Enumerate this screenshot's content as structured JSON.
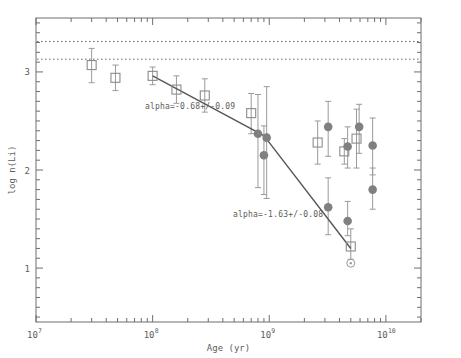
{
  "figure": {
    "axis_labels": {
      "x": "Age (yr)",
      "y": "log n(Li)"
    },
    "annotations": [
      {
        "id": "fit1",
        "text": "alpha=-0.68+/-0.09",
        "x": 0.345,
        "y": 2.62
      },
      {
        "id": "fit2",
        "text": "alpha=-1.63+/-0.08",
        "x": 2100000000.0,
        "y": 1.52
      }
    ],
    "xticklabels": [
      {
        "base": "10",
        "exp": "7",
        "value": 10000000.0
      },
      {
        "base": "10",
        "exp": "8",
        "value": 100000000.0
      },
      {
        "base": "10",
        "exp": "9",
        "value": 1000000000.0
      },
      {
        "base": "10",
        "exp": "10",
        "value": 10000000000.0
      }
    ],
    "yticklabels": [
      {
        "label": "1",
        "value": 1
      },
      {
        "label": "2",
        "value": 2
      },
      {
        "label": "3",
        "value": 3
      }
    ]
  },
  "chart_data": {
    "type": "scatter",
    "title": "",
    "xlabel": "Age (yr)",
    "ylabel": "log n(Li)",
    "xscale": "log",
    "yscale": "linear",
    "xlim": [
      10000000,
      20000000000
    ],
    "ylim": [
      0.45,
      3.55
    ],
    "grid": false,
    "legend": null,
    "reference_lines": [
      {
        "name": "meteoritic-abundance-upper",
        "style": "dotted",
        "y": 3.31
      },
      {
        "name": "meteoritic-abundance-lower",
        "style": "dotted",
        "y": 3.13
      }
    ],
    "fit_segments": [
      {
        "name": "early-decline-fit",
        "slope_label": "alpha=-0.68+/-0.09",
        "slope": -0.68,
        "slope_error": 0.09,
        "points": [
          [
            100000000,
            2.96
          ],
          [
            900000000,
            2.35
          ]
        ]
      },
      {
        "name": "late-decline-fit",
        "slope_label": "alpha=-1.63+/-0.08",
        "slope": -1.63,
        "slope_error": 0.08,
        "points": [
          [
            900000000,
            2.35
          ],
          [
            5000000000,
            1.2
          ]
        ]
      }
    ],
    "series": [
      {
        "name": "open-squares",
        "marker": "open-square",
        "color": "#8c8c8c",
        "points": [
          {
            "x": 30000000,
            "y": 3.07,
            "yerr_lo": 0.18,
            "yerr_hi": 0.17
          },
          {
            "x": 48000000,
            "y": 2.94,
            "yerr_lo": 0.13,
            "yerr_hi": 0.13
          },
          {
            "x": 100000000,
            "y": 2.96,
            "yerr_lo": 0.09,
            "yerr_hi": 0.09
          },
          {
            "x": 160000000,
            "y": 2.82,
            "yerr_lo": 0.14,
            "yerr_hi": 0.14
          },
          {
            "x": 280000000,
            "y": 2.76,
            "yerr_lo": 0.17,
            "yerr_hi": 0.17
          },
          {
            "x": 700000000,
            "y": 2.58,
            "yerr_lo": 0.21,
            "yerr_hi": 0.2
          },
          {
            "x": 2600000000,
            "y": 2.28,
            "yerr_lo": 0.22,
            "yerr_hi": 0.22
          },
          {
            "x": 4400000000,
            "y": 2.19,
            "yerr_lo": 0.13,
            "yerr_hi": 0.13
          },
          {
            "x": 5600000000,
            "y": 2.32,
            "yerr_lo": 0.3,
            "yerr_hi": 0.3
          },
          {
            "x": 5000000000,
            "y": 1.22,
            "yerr_lo": 0.13,
            "yerr_hi": 0.18
          }
        ]
      },
      {
        "name": "filled-circles",
        "marker": "filled-circle",
        "color": "#808080",
        "points": [
          {
            "x": 800000000,
            "y": 2.37,
            "yerr_lo": 0.55,
            "yerr_hi": 0.4
          },
          {
            "x": 950000000,
            "y": 2.33,
            "yerr_lo": 0.62,
            "yerr_hi": 0.52
          },
          {
            "x": 900000000,
            "y": 2.15,
            "yerr_lo": 0.4,
            "yerr_hi": 0.3
          },
          {
            "x": 3200000000,
            "y": 2.44,
            "yerr_lo": 0.3,
            "yerr_hi": 0.26
          },
          {
            "x": 4700000000,
            "y": 2.24,
            "yerr_lo": 0.22,
            "yerr_hi": 0.2
          },
          {
            "x": 5900000000,
            "y": 2.44,
            "yerr_lo": 0.27,
            "yerr_hi": 0.23
          },
          {
            "x": 7700000000,
            "y": 2.25,
            "yerr_lo": 0.3,
            "yerr_hi": 0.28
          },
          {
            "x": 3200000000,
            "y": 1.62,
            "yerr_lo": 0.28,
            "yerr_hi": 0.3
          },
          {
            "x": 4700000000,
            "y": 1.48,
            "yerr_lo": 0.15,
            "yerr_hi": 0.2
          },
          {
            "x": 7700000000,
            "y": 1.8,
            "yerr_lo": 0.2,
            "yerr_hi": 0.22
          }
        ]
      },
      {
        "name": "solar-symbol",
        "marker": "sun",
        "color": "#9a9a9a",
        "points": [
          {
            "x": 5000000000,
            "y": 1.05,
            "yerr_lo": 0,
            "yerr_hi": 0
          }
        ]
      }
    ]
  }
}
